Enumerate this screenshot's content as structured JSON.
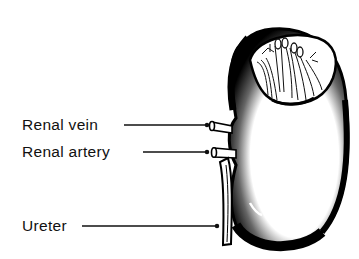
{
  "figure": {
    "labels": [
      {
        "id": "renal-vein",
        "text": "Renal vein"
      },
      {
        "id": "renal-artery",
        "text": "Renal artery"
      },
      {
        "id": "ureter",
        "text": "Ureter"
      }
    ]
  },
  "colors": {
    "ink": "#111111",
    "background": "#ffffff"
  }
}
